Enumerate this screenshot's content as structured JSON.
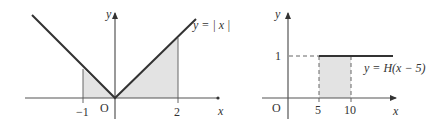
{
  "figures": [
    {
      "id": "abs-value",
      "function_label": "y = | x |",
      "axis_x_label": "x",
      "axis_y_label": "y",
      "origin_label": "O",
      "ticks": [
        "−1",
        "2"
      ],
      "shaded_interval": [
        -1,
        2
      ]
    },
    {
      "id": "heaviside",
      "function_label": "y = H(x − 5)",
      "axis_x_label": "x",
      "axis_y_label": "y",
      "origin_label": "O",
      "x_ticks": [
        "5",
        "10"
      ],
      "y_ticks": [
        "1"
      ],
      "shaded_interval": [
        5,
        10
      ]
    }
  ],
  "colors": {
    "axis": "#555555",
    "curve": "#333333",
    "shade": "#e3e3e3",
    "text": "#333333"
  }
}
